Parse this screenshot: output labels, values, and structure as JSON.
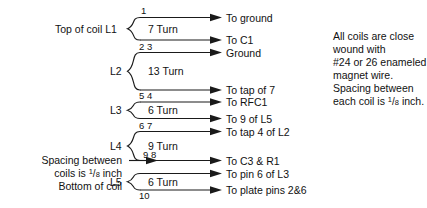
{
  "diagram": {
    "title_left_top": "Top of coil L1",
    "coils": [
      {
        "id": "L1",
        "label": "L1",
        "turns_label": "7 Turn",
        "top_tap": "1",
        "bottom_taps": "2 3"
      },
      {
        "id": "L2",
        "label": "L2",
        "turns_label": "13 Turn",
        "top_tap": "2 3",
        "bottom_taps": "5 4"
      },
      {
        "id": "L3",
        "label": "L3",
        "turns_label": "6 Turn",
        "top_tap": "5 4",
        "bottom_taps": "6 7"
      },
      {
        "id": "L4",
        "label": "L4",
        "turns_label": "9 Turn",
        "top_tap": "6 7",
        "bottom_taps": "9 8"
      },
      {
        "id": "L5",
        "label": "L5",
        "turns_label": "6 Turn",
        "top_tap": "9 8",
        "bottom_taps": "10"
      }
    ],
    "tap_numbers": {
      "n1": "1",
      "n23": "2 3",
      "n54": "5 4",
      "n67": "6 7",
      "n98": "9 8",
      "n10": "10"
    },
    "connections": [
      {
        "label": "To ground"
      },
      {
        "label": "To C1"
      },
      {
        "label": "Ground"
      },
      {
        "label": "To tap of 7"
      },
      {
        "label": "To RFC1"
      },
      {
        "label": "To 9 of L5"
      },
      {
        "label": "To tap 4 of L2"
      },
      {
        "label": "To C3 & R1"
      },
      {
        "label": "To pin 6 of L3"
      },
      {
        "label": "To plate pins 2&6"
      }
    ],
    "note_right": {
      "line1": "All coils are close",
      "line2": "wound with",
      "line3": "#24 or 26 enameled",
      "line4": "magnet wire.",
      "line5": "Spacing between",
      "line6_prefix": "each coil is ",
      "line6_num": "1",
      "line6_bar": "/",
      "line6_den": "8",
      "line6_suffix": " inch."
    },
    "note_left_bottom": {
      "line1": "Spacing between",
      "line2_prefix": "coils is ",
      "line2_num": "1",
      "line2_bar": "/",
      "line2_den": "8",
      "line2_suffix": " inch",
      "line3": "Bottom of coil"
    },
    "colors": {
      "ink": "#1a1a1a",
      "background": "#ffffff"
    }
  }
}
